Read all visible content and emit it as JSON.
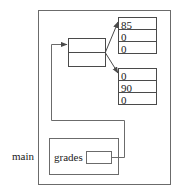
{
  "diagram": {
    "type": "memory-pointer-diagram",
    "stroke_color": "#555555",
    "text_color": "#1a1a1a",
    "background_color": "#ffffff",
    "frame": {
      "name": "main-frame",
      "label": "main"
    },
    "stack_variable": {
      "name": "grades",
      "label": "grades",
      "pointer_value": ""
    },
    "pointer_array": {
      "name": "pointer-array",
      "cells": [
        "",
        ""
      ]
    },
    "arrays": [
      {
        "name": "row-array-0",
        "cells": [
          "85",
          "0",
          "0"
        ]
      },
      {
        "name": "row-array-1",
        "cells": [
          "0",
          "90",
          "0"
        ]
      }
    ]
  }
}
